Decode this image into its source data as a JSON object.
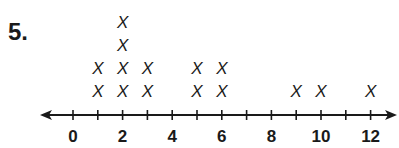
{
  "problem_number": "5.",
  "chart_data": {
    "type": "line_plot",
    "title": "",
    "xlabel": "",
    "ylabel": "",
    "marker": "X",
    "x_range": [
      0,
      12
    ],
    "tick_step": 1,
    "tick_labels": [
      "0",
      "2",
      "4",
      "6",
      "8",
      "10",
      "12"
    ],
    "categories": [
      0,
      1,
      2,
      3,
      4,
      5,
      6,
      7,
      8,
      9,
      10,
      11,
      12
    ],
    "values": [
      0,
      2,
      4,
      2,
      0,
      2,
      2,
      0,
      0,
      1,
      1,
      0,
      1
    ],
    "grid": false,
    "legend": null,
    "arrows": "both ends"
  }
}
